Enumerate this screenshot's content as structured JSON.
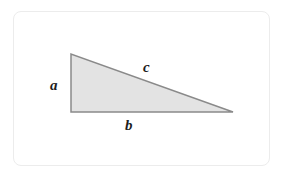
{
  "figure": {
    "kind": "right-triangle-diagram",
    "background_color": "#ffffff",
    "card": {
      "border_color": "#ececec",
      "fill_color": "#ffffff",
      "corner_radius": 8
    },
    "triangle": {
      "fill_color": "#e3e3e3",
      "stroke_color": "#8a8a8a",
      "stroke_width": 1.5,
      "vertices": [
        {
          "name": "apex-top-left",
          "x": 71,
          "y": 54
        },
        {
          "name": "corner-bottom-left",
          "x": 71,
          "y": 112
        },
        {
          "name": "corner-bottom-right",
          "x": 233,
          "y": 112
        }
      ],
      "right_angle_at": "corner-bottom-left"
    },
    "labels": {
      "leg_vertical": "a",
      "leg_horizontal": "b",
      "hypotenuse": "c",
      "text_color": "#1d1d1d"
    }
  }
}
